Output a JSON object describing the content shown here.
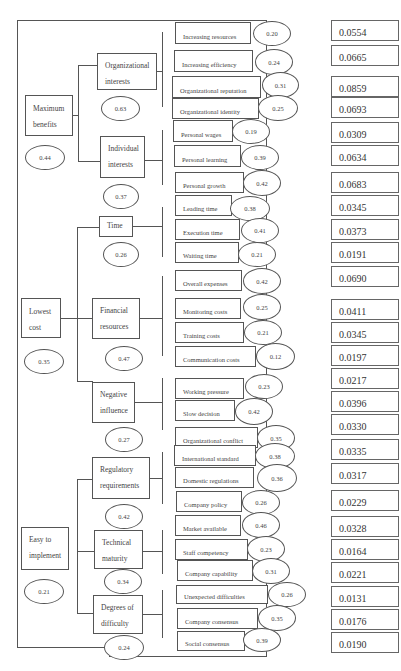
{
  "goals": [
    {
      "label_l1": "Maximum",
      "label_l2": "benefits",
      "weight": "0.44"
    },
    {
      "label_l1": "Lowest",
      "label_l2": "cost",
      "weight": "0.35"
    },
    {
      "label_l1": "Easy to",
      "label_l2": "implement",
      "weight": "0.21"
    }
  ],
  "criteria": [
    {
      "label_l1": "Organizational",
      "label_l2": "interests",
      "weight": "0.63"
    },
    {
      "label_l1": "Individual",
      "label_l2": "interests",
      "weight": "0.37"
    },
    {
      "label_l1": "Time",
      "label_l2": "",
      "weight": "0.26"
    },
    {
      "label_l1": "Financial",
      "label_l2": "resources",
      "weight": "0.47"
    },
    {
      "label_l1": "Negative",
      "label_l2": "influence",
      "weight": "0.27"
    },
    {
      "label_l1": "Regulatory",
      "label_l2": "requirements",
      "weight": "0.42"
    },
    {
      "label_l1": "Technical",
      "label_l2": "maturity",
      "weight": "0.34"
    },
    {
      "label_l1": "Degrees of",
      "label_l2": "difficulty",
      "weight": "0.24"
    }
  ],
  "subcriteria": [
    {
      "label": "Increasing resources",
      "local": "0.20",
      "global": "0.0554"
    },
    {
      "label": "Increasing efficiency",
      "local": "0.24",
      "global": "0.0665"
    },
    {
      "label": "Organizational reputation",
      "local": "0.31",
      "global": "0.0859"
    },
    {
      "label": "Organizational identity",
      "local": "0.25",
      "global": "0.0693"
    },
    {
      "label": "Personal wages",
      "local": "0.19",
      "global": "0.0309"
    },
    {
      "label": "Personal learning",
      "local": "0.39",
      "global": "0.0634"
    },
    {
      "label": "Personal growth",
      "local": "0.42",
      "global": "0.0683"
    },
    {
      "label": "Leading time",
      "local": "0.38",
      "global": "0.0345"
    },
    {
      "label": "Execution time",
      "local": "0.41",
      "global": "0.0373"
    },
    {
      "label": "Waiting time",
      "local": "0.21",
      "global": "0.0191"
    },
    {
      "label": "Overall expenses",
      "local": "0.42",
      "global": "0.0690"
    },
    {
      "label": "Monitoring costs",
      "local": "0.25",
      "global": "0.0411"
    },
    {
      "label": "Training costs",
      "local": "0.21",
      "global": "0.0345"
    },
    {
      "label": "Communication costs",
      "local": "0.12",
      "global": "0.0197"
    },
    {
      "label": "Working pressure",
      "local": "0.23",
      "global": "0.0217"
    },
    {
      "label": "Slow decision",
      "local": "0.42",
      "global": "0.0396"
    },
    {
      "label": "Organizational conflict",
      "local": "0.35",
      "global": "0.0330"
    },
    {
      "label": "International standard",
      "local": "0.38",
      "global": "0.0335"
    },
    {
      "label": "Domestic regulations",
      "local": "0.36",
      "global": "0.0317"
    },
    {
      "label": "Company policy",
      "local": "0.26",
      "global": "0.0229"
    },
    {
      "label": "Market available",
      "local": "0.46",
      "global": "0.0328"
    },
    {
      "label": "Staff competency",
      "local": "0.23",
      "global": "0.0164"
    },
    {
      "label": "Company capability",
      "local": "0.31",
      "global": "0.0221"
    },
    {
      "label": "Unexpected difficulties",
      "local": "0.26",
      "global": "0.0131"
    },
    {
      "label": "Company consensus",
      "local": "0.35",
      "global": "0.0176"
    },
    {
      "label": "Social consensus",
      "local": "0.39",
      "global": "0.0190"
    }
  ]
}
